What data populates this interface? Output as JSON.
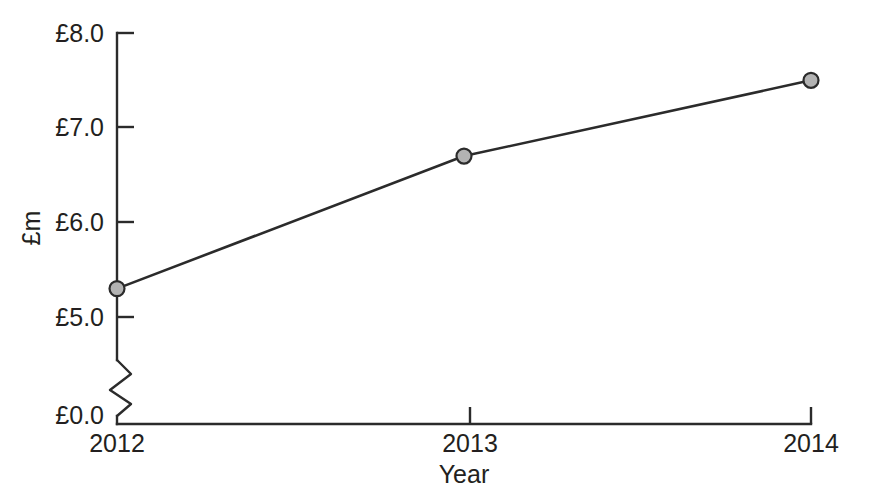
{
  "chart_data": {
    "type": "line",
    "title": "",
    "subtitle": "",
    "xlabel": "Year",
    "ylabel": "£m",
    "categories": [
      "2012",
      "2013",
      "2014"
    ],
    "x": [
      2012,
      2013,
      2014
    ],
    "values": [
      5.3,
      6.7,
      7.5
    ],
    "series": [
      {
        "name": "",
        "values": [
          5.3,
          6.7,
          7.5
        ]
      }
    ],
    "ytick_labels": [
      "£0.0",
      "£5.0",
      "£6.0",
      "£7.0",
      "£8.0"
    ],
    "ytick_values": [
      0.0,
      5.0,
      6.0,
      7.0,
      8.0
    ],
    "xtick_labels": [
      "2012",
      "2013",
      "2014"
    ],
    "ylim": [
      5.0,
      8.0
    ],
    "axis_break": true,
    "axis_break_note": "zigzag break on y-axis between £0.0 and £5.0",
    "grid": false,
    "legend": false,
    "legend_position": "none",
    "annotations": [],
    "colors": {
      "line": "#2b2b2b",
      "marker_fill": "#b3b3b3",
      "marker_stroke": "#2b2b2b",
      "axis": "#2b2b2b",
      "text": "#231f20",
      "background": "#ffffff"
    }
  },
  "labels": {
    "y_axis_title": "£m",
    "x_axis_title": "Year",
    "y_tick_0": "£8.0",
    "y_tick_1": "£7.0",
    "y_tick_2": "£6.0",
    "y_tick_3": "£5.0",
    "y_tick_4": "£0.0",
    "x_tick_0": "2012",
    "x_tick_1": "2013",
    "x_tick_2": "2014"
  }
}
